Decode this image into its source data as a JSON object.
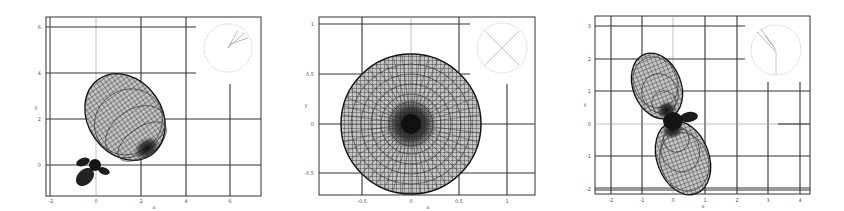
{
  "figure": {
    "background": "#ffffff",
    "line_color": "#222222",
    "mesh_fill": "#bdbdbd"
  },
  "chart_data": [
    {
      "type": "scatter",
      "subtype": "3d-radiation-pattern-top-view",
      "title": "",
      "xlabel": "x",
      "ylabel": "y",
      "xticks": [
        "-2",
        "0",
        "2",
        "4",
        "6"
      ],
      "yticks": [
        "6",
        "4",
        "2",
        "0"
      ],
      "xlim": [
        -2.2,
        7.4
      ],
      "ylim": [
        -0.9,
        6.4
      ],
      "grid": true,
      "main_lobe": {
        "direction_deg": 55,
        "center": [
          1.2,
          2.0
        ],
        "length": 3.7,
        "width": 2.6
      },
      "back_lobe": {
        "direction_deg": 235,
        "center": [
          -0.9,
          -0.9
        ],
        "length": 0.9,
        "width": 0.7
      },
      "side_lobes": [
        {
          "direction_deg": 150
        },
        {
          "direction_deg": -30
        }
      ],
      "inset": {
        "type": "polar-orientation",
        "lines": 3,
        "direction_deg": 55
      }
    },
    {
      "type": "scatter",
      "subtype": "3d-radiation-pattern-top-view",
      "title": "",
      "xlabel": "x",
      "ylabel": "y",
      "xticks": [
        "-0.5",
        "0",
        "0.5",
        "1"
      ],
      "yticks": [
        "1",
        "0.5",
        "0",
        "-0.5"
      ],
      "xlim": [
        -0.95,
        1.29
      ],
      "ylim": [
        -0.72,
        1.08
      ],
      "grid": true,
      "main_lobe": {
        "shape": "circle",
        "center": [
          0,
          0
        ],
        "radius": 0.72
      },
      "inset": {
        "type": "polar-orientation",
        "lines": 2,
        "pattern": "cross"
      }
    },
    {
      "type": "scatter",
      "subtype": "3d-radiation-pattern-top-view",
      "title": "",
      "xlabel": "x",
      "ylabel": "y",
      "xticks": [
        "-2",
        "-1",
        "0",
        "1",
        "2",
        "3",
        "4"
      ],
      "yticks": [
        "3",
        "2",
        "1",
        "0",
        "-1",
        "-2"
      ],
      "xlim": [
        -2.5,
        4.3
      ],
      "ylim": [
        -2.25,
        3.3
      ],
      "grid": true,
      "main_lobe": {
        "direction_deg": 115,
        "center": [
          -0.6,
          1.1
        ],
        "length": 2.0,
        "width": 1.6
      },
      "back_lobe": {
        "direction_deg": -70,
        "center": [
          0.3,
          -1.05
        ],
        "length": 2.3,
        "width": 1.65
      },
      "side_lobes": [
        {
          "direction_deg": 15,
          "center": [
            0.5,
            0.2
          ]
        }
      ],
      "inset": {
        "type": "polar-orientation",
        "lines": 3,
        "direction_deg": 130
      }
    }
  ]
}
